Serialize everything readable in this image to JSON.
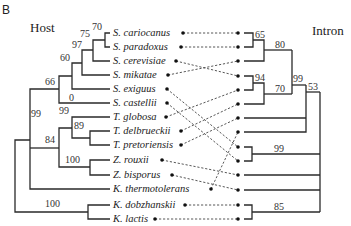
{
  "panel_label": "B",
  "host": {
    "title": "Host",
    "taxa": [
      "S. cariocanus",
      "S. paradoxus",
      "S. cerevisiae",
      "S. mikatae",
      "S. exiguus",
      "S. castellii",
      "T. globosa",
      "T. delbrueckii",
      "T. pretoriensis",
      "Z. rouxii",
      "Z. bisporus",
      "K. thermotolerans",
      "K. dobzhanskii",
      "K. lactis"
    ],
    "support_values": {
      "cariocanus_paradoxus": "70",
      "plus_cerevisiae": "75",
      "plus_mikatae": "97",
      "plus_exiguus": "60",
      "plus_castellii": "66",
      "castellii_branch": "0",
      "torulaspora": "99",
      "delbrueckii_pretoriensis": "89",
      "torulaspora_zygosaccharomyces": "84",
      "zygosaccharomyces": "100",
      "saccharomyces_torulaspora_zygo": "99",
      "kluyveromyces": "100"
    }
  },
  "intron": {
    "title": "Intron",
    "support_values": {
      "top_pair": "65",
      "top_triplet": "80",
      "second_pair": "94",
      "second_triplet": "70",
      "upper_clade": "99",
      "upper_plus": "53",
      "lower_pair": "99",
      "bottom_pair": "85"
    }
  },
  "links": [
    {
      "host": "S. cariocanus",
      "intron_row": 0
    },
    {
      "host": "S. paradoxus",
      "intron_row": 1
    },
    {
      "host": "S. cerevisiae",
      "intron_row": 3
    },
    {
      "host": "S. mikatae",
      "intron_row": 2
    },
    {
      "host": "S. exiguus",
      "intron_row": 8
    },
    {
      "host": "S. castellii",
      "intron_row": 9
    },
    {
      "host": "T. globosa",
      "intron_row": 4
    },
    {
      "host": "T. delbrueckii",
      "intron_row": 5
    },
    {
      "host": "T. pretoriensis",
      "intron_row": 6
    },
    {
      "host": "Z. rouxii",
      "intron_row": 10
    },
    {
      "host": "Z. bisporus",
      "intron_row": 11
    },
    {
      "host": "K. thermotolerans",
      "intron_row": 7
    },
    {
      "host": "K. dobzhanskii",
      "intron_row": 12
    },
    {
      "host": "K. lactis",
      "intron_row": 13
    }
  ]
}
